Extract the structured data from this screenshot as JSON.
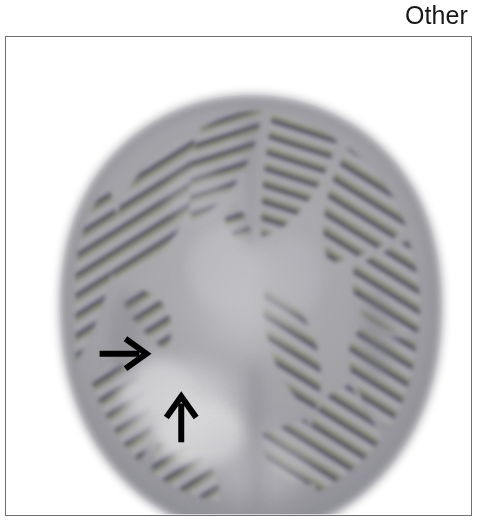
{
  "figure": {
    "label": "Other",
    "modality_caption": ""
  },
  "frame": {
    "border_color": "#6d6f72",
    "background_color": "#ffffff"
  },
  "scan": {
    "type": "axial-brain-perfusion-scan",
    "background_color": "#ffffff",
    "parenchyma_color": "#9a9a9e",
    "bright_region_color": "#d2d2d4",
    "stripe_dark_color": "#4a4460",
    "stripe_olive_color": "#7d7a52",
    "stripe_green_color": "#5f7b63",
    "brain_bounds": {
      "cx": 246,
      "cy": 279,
      "rx": 194,
      "ry": 221
    }
  },
  "annotations": [
    {
      "name": "arrow-right-marker",
      "direction": "right",
      "color": "#000000",
      "tip_x": 146,
      "tip_y": 354,
      "tail_x": 100,
      "tail_y": 354
    },
    {
      "name": "arrow-up-marker",
      "direction": "up",
      "color": "#000000",
      "tip_x": 181,
      "tip_y": 396,
      "tail_x": 181,
      "tail_y": 443
    }
  ]
}
